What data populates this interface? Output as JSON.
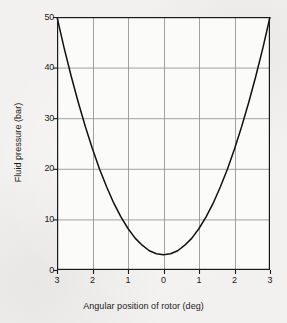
{
  "figure": {
    "background_color": "#f2f1ef",
    "ink_color": "#1a1a1a",
    "grid_color": "#8a8a8a"
  },
  "chart_data": {
    "type": "line",
    "title": "",
    "subtitle": "",
    "xlabel": "Angular position of rotor (deg)",
    "ylabel": "Fluid pressure (bar)",
    "xlim": [
      -3,
      3
    ],
    "ylim": [
      0,
      50
    ],
    "grid": true,
    "legend": "none",
    "x_tick_values": [
      -3,
      -2,
      -1,
      0,
      1,
      2,
      3
    ],
    "x_tick_labels": [
      "3",
      "2",
      "1",
      "0",
      "1",
      "2",
      "3"
    ],
    "y_tick_values": [
      0,
      10,
      20,
      30,
      40,
      50
    ],
    "y_tick_labels": [
      "0",
      "10",
      "20",
      "30",
      "40",
      "50"
    ],
    "x_gridlines": [
      -3,
      -2,
      -1,
      0,
      1,
      2,
      3
    ],
    "y_gridlines": [
      10,
      20,
      30,
      40,
      50
    ],
    "series": [
      {
        "name": "Fluid pressure",
        "color": "#111111",
        "curve_form": "p = 3.0 + 5.22 * theta^2",
        "x": [
          -3.0,
          -2.8,
          -2.6,
          -2.4,
          -2.2,
          -2.0,
          -1.8,
          -1.6,
          -1.4,
          -1.2,
          -1.0,
          -0.8,
          -0.6,
          -0.4,
          -0.2,
          0.0,
          0.2,
          0.4,
          0.6,
          0.8,
          1.0,
          1.2,
          1.4,
          1.6,
          1.8,
          2.0,
          2.2,
          2.4,
          2.6,
          2.8,
          3.0
        ],
        "values": [
          50.0,
          43.9,
          38.3,
          33.1,
          28.3,
          23.9,
          19.9,
          16.4,
          13.2,
          10.5,
          8.2,
          6.3,
          4.9,
          3.8,
          3.2,
          3.0,
          3.2,
          3.8,
          4.9,
          6.3,
          8.2,
          10.5,
          13.2,
          16.4,
          19.9,
          23.9,
          28.3,
          33.1,
          38.3,
          43.9,
          50.0
        ]
      }
    ],
    "annotations": {
      "minimum_pressure_bar": 3.0,
      "minimum_at_deg": 0.0,
      "maximum_pressure_bar": 50.0
    }
  }
}
